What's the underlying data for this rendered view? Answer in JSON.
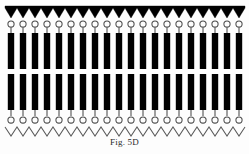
{
  "figure": {
    "caption": "Fig. 5D",
    "title": "Fig. 5D",
    "background_color": "#fdfdfd",
    "ink_color": "#000000",
    "line_color": "#555555",
    "structure_description": "Schematic cross-section: serrated black top band, row of open circles on stems, two stacked rows of tall black vertical bars, row of open circles on stems, open zigzag line at bottom",
    "units_count": 20,
    "unit_pitch_px": 12,
    "layers": [
      {
        "name": "top-serrated-band",
        "shape": "sawtooth",
        "fill": "#000000",
        "teeth": 20,
        "y_top": 6,
        "y_base": 8,
        "tooth_depth_px": 10,
        "filled": true
      },
      {
        "name": "top-circle-row",
        "shape": "open-circles",
        "count": 20,
        "radius_px": 3.1,
        "center_y": 24,
        "stroke": "#4a4a4a",
        "filled": false
      },
      {
        "name": "top-stem-row",
        "shape": "vertical-stems",
        "count": 20,
        "y_start": 27,
        "y_end": 33,
        "stroke": "#4a4a4a"
      },
      {
        "name": "upper-bar-row",
        "shape": "vertical-bars",
        "count": 20,
        "fill": "#000000",
        "y_top": 33,
        "y_bottom": 69,
        "bar_width_px": 6.4
      },
      {
        "name": "lower-bar-row",
        "shape": "vertical-bars",
        "count": 20,
        "fill": "#000000",
        "y_top": 74,
        "y_bottom": 110,
        "bar_width_px": 6.4
      },
      {
        "name": "bottom-stem-row",
        "shape": "vertical-stems",
        "count": 20,
        "y_start": 110,
        "y_end": 116,
        "stroke": "#4a4a4a"
      },
      {
        "name": "bottom-circle-row",
        "shape": "open-circles",
        "count": 20,
        "radius_px": 3.1,
        "center_y": 120,
        "stroke": "#4a4a4a",
        "filled": false
      },
      {
        "name": "bottom-zigzag",
        "shape": "sawtooth-outline",
        "count": 20,
        "y_top": 127,
        "y_bottom": 136,
        "stroke": "#5a5a5a",
        "filled": false
      }
    ]
  }
}
